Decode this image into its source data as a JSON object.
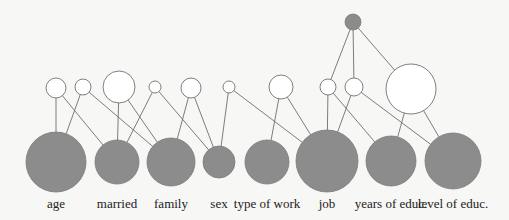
{
  "diagram": {
    "type": "bayesian-network",
    "colors": {
      "observed": "#8c8c8c",
      "hidden": "#ffffff",
      "edge": "#6e6e6e",
      "background": "#f7f7f5"
    },
    "root": {
      "id": "root",
      "x": 353,
      "y": 22,
      "r": 8,
      "kind": "observed"
    },
    "hidden_nodes": [
      {
        "id": "h1",
        "x": 56,
        "y": 88,
        "r": 10
      },
      {
        "id": "h2",
        "x": 83,
        "y": 87,
        "r": 8
      },
      {
        "id": "h3",
        "x": 119,
        "y": 87,
        "r": 16
      },
      {
        "id": "h4",
        "x": 155,
        "y": 87,
        "r": 6
      },
      {
        "id": "h5",
        "x": 191,
        "y": 88,
        "r": 10
      },
      {
        "id": "h6",
        "x": 229,
        "y": 87,
        "r": 6
      },
      {
        "id": "h7",
        "x": 281,
        "y": 87,
        "r": 12
      },
      {
        "id": "h8",
        "x": 328,
        "y": 87,
        "r": 8
      },
      {
        "id": "h9",
        "x": 354,
        "y": 87,
        "r": 9
      },
      {
        "id": "h10",
        "x": 411,
        "y": 89,
        "r": 25
      }
    ],
    "observed_nodes": [
      {
        "id": "age",
        "label": "age",
        "x": 56,
        "y": 162,
        "r": 30
      },
      {
        "id": "married",
        "label": "married",
        "x": 117,
        "y": 162,
        "r": 22
      },
      {
        "id": "family",
        "label": "family",
        "x": 171,
        "y": 162,
        "r": 24
      },
      {
        "id": "sex",
        "label": "sex",
        "x": 219,
        "y": 162,
        "r": 16
      },
      {
        "id": "type_of_work",
        "label": "type of work",
        "x": 267,
        "y": 162,
        "r": 22
      },
      {
        "id": "job",
        "label": "job",
        "x": 327,
        "y": 161,
        "r": 31
      },
      {
        "id": "years_of_educ",
        "label": "years of educ.",
        "x": 391,
        "y": 161,
        "r": 25
      },
      {
        "id": "level_of_educ",
        "label": "level of educ.",
        "x": 453,
        "y": 161,
        "r": 28
      }
    ],
    "edges": [
      [
        "h1",
        "age"
      ],
      [
        "h1",
        "married"
      ],
      [
        "h2",
        "age"
      ],
      [
        "h2",
        "family"
      ],
      [
        "h3",
        "married"
      ],
      [
        "h3",
        "family"
      ],
      [
        "h4",
        "married"
      ],
      [
        "h4",
        "sex"
      ],
      [
        "h5",
        "family"
      ],
      [
        "h5",
        "sex"
      ],
      [
        "h6",
        "sex"
      ],
      [
        "h6",
        "job"
      ],
      [
        "h7",
        "type_of_work"
      ],
      [
        "h7",
        "job"
      ],
      [
        "h8",
        "job"
      ],
      [
        "h8",
        "years_of_educ"
      ],
      [
        "h9",
        "job"
      ],
      [
        "h9",
        "level_of_educ"
      ],
      [
        "h10",
        "years_of_educ"
      ],
      [
        "h10",
        "level_of_educ"
      ],
      [
        "root",
        "h8"
      ],
      [
        "root",
        "h9"
      ],
      [
        "root",
        "h10"
      ]
    ],
    "label_y": 208
  }
}
